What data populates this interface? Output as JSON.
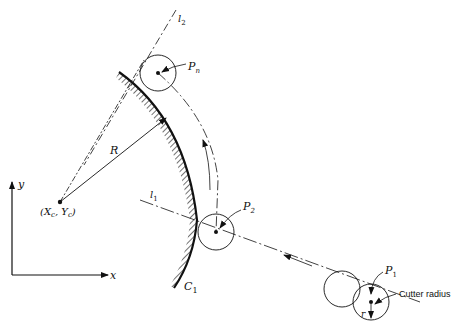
{
  "figure": {
    "labels": {
      "l2": "l",
      "l2_sub": "2",
      "l1": "l",
      "l1_sub": "1",
      "pn": "P",
      "pn_sub": "n",
      "p2": "P",
      "p2_sub": "2",
      "p1": "P",
      "p1_sub": "1",
      "R": "R",
      "center": "(X",
      "center_sub1": "c",
      "center_mid": ", Y",
      "center_sub2": "c",
      "center_end": ")",
      "C1": "C",
      "C1_sub": "1",
      "cutter_radius": "Cutter radius",
      "r": "r",
      "axis_x": "x",
      "axis_y": "y"
    },
    "colors": {
      "ink": "#111111",
      "background": "#ffffff"
    }
  }
}
